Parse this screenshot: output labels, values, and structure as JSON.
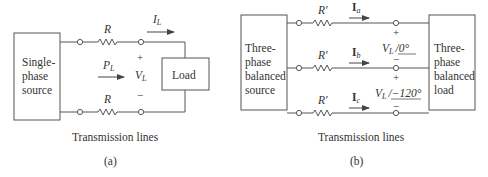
{
  "diagram_a": {
    "source_label": [
      "Single-",
      "phase",
      "source"
    ],
    "resistor_top": "R",
    "resistor_bottom": "R",
    "current_label": "I",
    "current_sub": "L",
    "power_label": "P",
    "power_sub": "L",
    "voltage_label": "V",
    "voltage_sub": "L",
    "plus": "+",
    "minus": "−",
    "load_label": "Load",
    "lines_caption": "Transmission lines",
    "panel_caption": "(a)"
  },
  "diagram_b": {
    "source_label": [
      "Three-",
      "phase",
      "balanced",
      "source"
    ],
    "resistor_label": "R′",
    "currents": [
      {
        "label": "I",
        "sub": "a"
      },
      {
        "label": "I",
        "sub": "b"
      },
      {
        "label": "I",
        "sub": "c"
      }
    ],
    "voltages": [
      {
        "label": "V",
        "sub": "L",
        "angle": "/0°"
      },
      {
        "label": "V",
        "sub": "L",
        "angle": "/−120°"
      }
    ],
    "plus": "+",
    "minus": "−",
    "load_label": [
      "Three-",
      "phase",
      "balanced",
      "load"
    ],
    "lines_caption": "Transmission lines",
    "panel_caption": "(b)"
  },
  "colors": {
    "line": "#555555",
    "text": "#333333"
  }
}
